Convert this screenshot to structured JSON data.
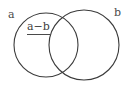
{
  "figure": {
    "type": "venn-diagram",
    "title": "",
    "background_color": "#ffffff",
    "stroke_color": "#3b3b3b",
    "text_color": "#4a4a4a",
    "width": 130,
    "height": 86
  },
  "labels": {
    "set_a": "a",
    "set_b": "b",
    "region_a_minus_b": "a−b"
  },
  "shapes": {
    "circle_a": {
      "cx": 46,
      "cy": 45,
      "r": 32
    },
    "circle_b": {
      "cx": 84,
      "cy": 45,
      "r": 35
    }
  }
}
